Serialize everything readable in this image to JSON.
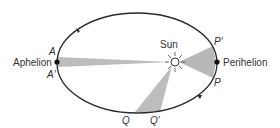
{
  "diagram": {
    "labels": {
      "aphelion": "Aphelion",
      "perihelion": "Perihelion",
      "sun": "Sun",
      "A": "A",
      "A_prime": "A′",
      "P": "P",
      "P_prime": "P′",
      "Q": "Q",
      "Q_prime": "Q′"
    },
    "colors": {
      "orbit": "#2a2a2a",
      "sector_fill": "#b8b8b8",
      "text": "#333333"
    }
  }
}
